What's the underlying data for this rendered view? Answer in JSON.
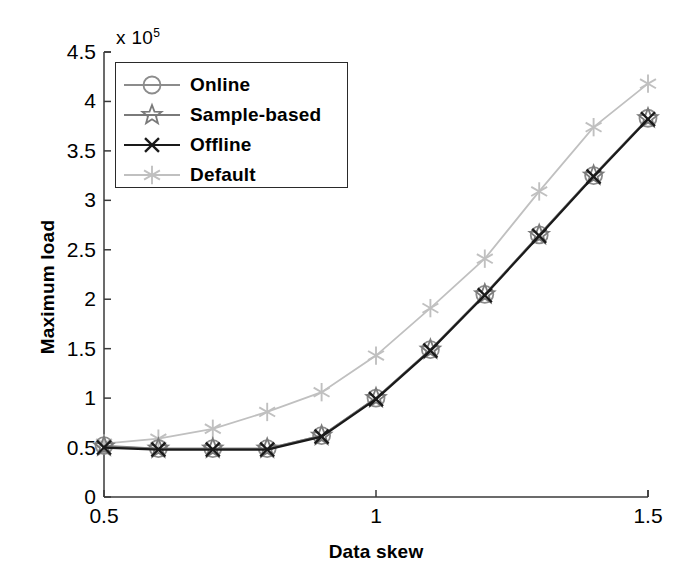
{
  "chart_data": {
    "type": "line",
    "title": "",
    "xlabel": "Data skew",
    "ylabel": "Maximum load",
    "y_exponent_label": "x 10",
    "y_exponent_value": "5",
    "y_scale": 100000,
    "xlim": [
      0.5,
      1.5
    ],
    "ylim": [
      0,
      450000
    ],
    "xticks": [
      "0.5",
      "1",
      "1.5"
    ],
    "xtick_values": [
      0.5,
      1.0,
      1.5
    ],
    "yticks": [
      "0",
      "0.5",
      "1",
      "1.5",
      "2",
      "2.5",
      "3",
      "3.5",
      "4",
      "4.5"
    ],
    "ytick_values": [
      0,
      0.5,
      1,
      1.5,
      2,
      2.5,
      3,
      3.5,
      4,
      4.5
    ],
    "grid": false,
    "legend_position": "upper left",
    "x": [
      0.5,
      0.6,
      0.7,
      0.8,
      0.9,
      1.0,
      1.1,
      1.2,
      1.3,
      1.4,
      1.5
    ],
    "series": [
      {
        "name": "Online",
        "marker": "circle",
        "color": "#8c8c8c",
        "values": [
          0.52,
          0.49,
          0.49,
          0.49,
          0.62,
          1.0,
          1.49,
          2.05,
          2.65,
          3.25,
          3.83
        ]
      },
      {
        "name": "Sample-based",
        "marker": "pentagram",
        "color": "#7a7a7a",
        "values": [
          0.51,
          0.49,
          0.49,
          0.49,
          0.62,
          1.0,
          1.49,
          2.05,
          2.65,
          3.25,
          3.83
        ]
      },
      {
        "name": "Offline",
        "marker": "x",
        "color": "#1a1a1a",
        "values": [
          0.5,
          0.48,
          0.48,
          0.48,
          0.61,
          0.99,
          1.48,
          2.04,
          2.64,
          3.24,
          3.82
        ]
      },
      {
        "name": "Default",
        "marker": "asterisk",
        "color": "#c0c0c0",
        "values": [
          0.54,
          0.59,
          0.69,
          0.86,
          1.06,
          1.43,
          1.91,
          2.41,
          3.09,
          3.74,
          4.18
        ]
      }
    ]
  },
  "legend": {
    "entries": [
      {
        "label": "Online"
      },
      {
        "label": "Sample-based"
      },
      {
        "label": "Offline"
      },
      {
        "label": "Default"
      }
    ]
  }
}
